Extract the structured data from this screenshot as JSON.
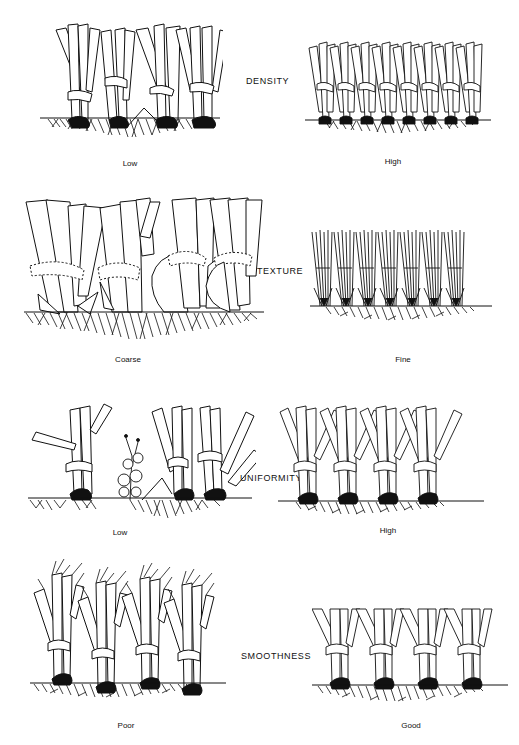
{
  "figure": {
    "rows": [
      {
        "attribute": "DENSITY",
        "left": {
          "caption": "Low",
          "shoots": 4,
          "style": "sparse"
        },
        "right": {
          "caption": "High",
          "shoots": 8,
          "style": "dense"
        }
      },
      {
        "attribute": "TEXTURE",
        "left": {
          "caption": "Coarse",
          "shoots": 4,
          "style": "coarse"
        },
        "right": {
          "caption": "Fine",
          "shoots": 7,
          "style": "fine"
        }
      },
      {
        "attribute": "UNIFORMITY",
        "left": {
          "caption": "Low",
          "shoots": 3,
          "style": "weedy",
          "extra": "broadleaf weed"
        },
        "right": {
          "caption": "High",
          "shoots": 4,
          "style": "uniform"
        }
      },
      {
        "attribute": "SMOOTHNESS",
        "left": {
          "caption": "Poor",
          "shoots": 4,
          "style": "frayed"
        },
        "right": {
          "caption": "Good",
          "shoots": 4,
          "style": "clean-cut"
        }
      }
    ],
    "colors": {
      "ink": "#111111",
      "background": "#ffffff"
    }
  }
}
